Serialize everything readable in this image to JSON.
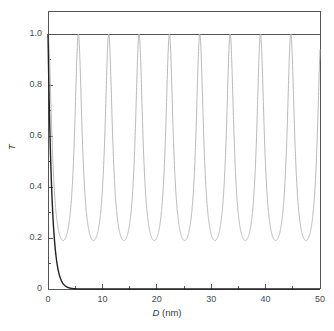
{
  "chart_data": {
    "type": "line",
    "title": "",
    "xlabel": "D (nm)",
    "xlabel_symbol": "D",
    "xlabel_unit": "(nm)",
    "ylabel": "T",
    "xlim": [
      0,
      50
    ],
    "ylim": [
      0,
      1.0
    ],
    "xticks": [
      0,
      10,
      20,
      30,
      40,
      50
    ],
    "xticklabels": [
      "0",
      "10",
      "20",
      "30",
      "40",
      "50"
    ],
    "xminor_ticks": [
      5,
      15,
      25,
      35,
      45
    ],
    "yticks": [
      0,
      0.2,
      0.4,
      0.6,
      0.8,
      1.0
    ],
    "yticklabels": [
      "0",
      "0.2",
      "0.4",
      "0.6",
      "0.8",
      "1.0"
    ],
    "yminor_ticks": [
      0.1,
      0.3,
      0.5,
      0.7,
      0.9
    ],
    "grid": false,
    "legend": "none",
    "frame": "box-extends-above-1.0",
    "series": [
      {
        "name": "oscillating-transmission",
        "color": "#b9b9b9",
        "style": "solid",
        "linewidth": 1.0,
        "description": "Fabry-Perot style resonance oscillation, peaks at T=1.0, minima at T=0.19",
        "peak_value": 1.0,
        "trough_value": 0.19,
        "period_nm": 5.58,
        "first_peak_nm": 0.0,
        "peak_positions_nm": [
          0.0,
          5.58,
          11.16,
          16.74,
          22.32,
          27.9,
          33.48,
          39.06,
          44.64,
          50.0
        ],
        "trough_positions_nm": [
          2.79,
          8.37,
          13.95,
          19.53,
          25.11,
          30.69,
          36.27,
          41.85,
          47.43
        ]
      },
      {
        "name": "decaying-transmission",
        "color": "#222222",
        "style": "solid",
        "linewidth": 1.4,
        "description": "Exponential tunneling decay from T=1.0 at D=0 to ~0 by D=6 nm",
        "decay_length_nm": 0.72,
        "x": [
          0,
          0.25,
          0.5,
          0.75,
          1.0,
          1.25,
          1.5,
          1.75,
          2.0,
          2.5,
          3.0,
          3.5,
          4.0,
          4.5,
          5.0,
          6.0,
          8.0,
          10.0,
          20.0,
          30.0,
          40.0,
          50.0
        ],
        "y": [
          1.0,
          0.84,
          0.68,
          0.53,
          0.41,
          0.31,
          0.23,
          0.17,
          0.125,
          0.068,
          0.037,
          0.021,
          0.012,
          0.007,
          0.004,
          0.0015,
          0.0003,
          0.0001,
          0.0,
          0.0,
          0.0,
          0.0
        ]
      }
    ]
  },
  "figure": {
    "background_color": "#ffffff",
    "axis_color": "#555555",
    "tick_label_color": "#4a4a4a"
  }
}
